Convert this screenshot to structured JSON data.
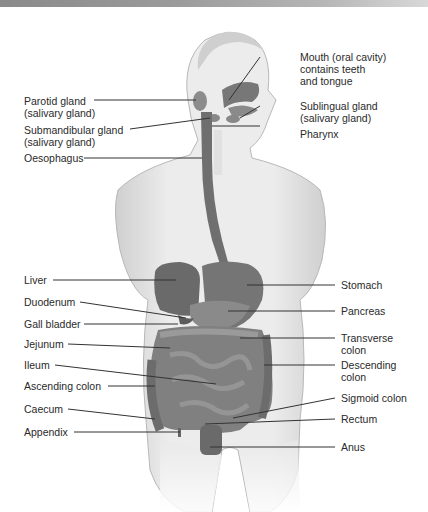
{
  "header": {
    "bar_colors": [
      "#8a8a8a",
      "#d8d8d8"
    ]
  },
  "figure": {
    "colors": {
      "skin": "#e4e4e4",
      "skin_shadow": "#c4c4c4",
      "organ": "#7a7a7a",
      "organ_dark": "#5e5e5e",
      "leader": "#333333"
    }
  },
  "labels_left": [
    {
      "id": "parotid",
      "text": "Parotid gland\n(salivary gland)"
    },
    {
      "id": "submandibular",
      "text": "Submandibular gland\n(salivary gland)"
    },
    {
      "id": "oesophagus",
      "text": "Oesophagus"
    },
    {
      "id": "liver",
      "text": "Liver"
    },
    {
      "id": "duodenum",
      "text": "Duodenum"
    },
    {
      "id": "gall_bladder",
      "text": "Gall bladder"
    },
    {
      "id": "jejunum",
      "text": "Jejunum"
    },
    {
      "id": "ileum",
      "text": "Ileum"
    },
    {
      "id": "ascending_colon",
      "text": "Ascending colon"
    },
    {
      "id": "caecum",
      "text": "Caecum"
    },
    {
      "id": "appendix",
      "text": "Appendix"
    }
  ],
  "labels_right": [
    {
      "id": "mouth",
      "text": "Mouth (oral cavity)\ncontains teeth\nand tongue"
    },
    {
      "id": "sublingual",
      "text": "Sublingual gland\n(salivary gland)"
    },
    {
      "id": "pharynx",
      "text": "Pharynx"
    },
    {
      "id": "stomach",
      "text": "Stomach"
    },
    {
      "id": "pancreas",
      "text": "Pancreas"
    },
    {
      "id": "transverse_colon",
      "text": "Transverse\ncolon"
    },
    {
      "id": "descending_colon",
      "text": "Descending\ncolon"
    },
    {
      "id": "sigmoid_colon",
      "text": "Sigmoid colon"
    },
    {
      "id": "rectum",
      "text": "Rectum"
    },
    {
      "id": "anus",
      "text": "Anus"
    }
  ]
}
